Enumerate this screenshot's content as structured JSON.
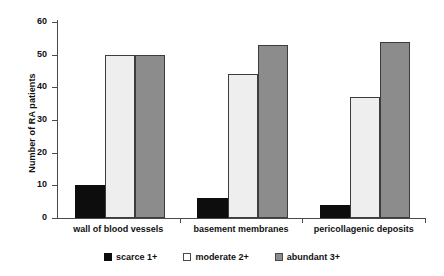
{
  "chart_data": {
    "type": "bar",
    "title": "",
    "xlabel": "",
    "ylabel": "Number of RA patients",
    "ylim": [
      0,
      60
    ],
    "ytick_step": 10,
    "yticks": [
      60,
      50,
      40,
      30,
      20,
      10,
      0
    ],
    "grid": false,
    "legend_position": "bottom",
    "categories": [
      "wall of blood vessels",
      "basement membranes",
      "pericollagenic deposits"
    ],
    "series": [
      {
        "name": "scarce 1+",
        "values": [
          10,
          6,
          4
        ],
        "color": "#0d0d0d"
      },
      {
        "name": "moderate 2+",
        "values": [
          50,
          44,
          37
        ],
        "color": "#eeeeee"
      },
      {
        "name": "abundant 3+",
        "values": [
          50,
          53,
          54
        ],
        "color": "#8c8c8c"
      }
    ]
  },
  "legend": {
    "items": [
      {
        "label": "scarce 1+",
        "swatch": "scarce"
      },
      {
        "label": "moderate 2+",
        "swatch": "moderate"
      },
      {
        "label": "abundant 3+",
        "swatch": "abundant"
      }
    ]
  }
}
